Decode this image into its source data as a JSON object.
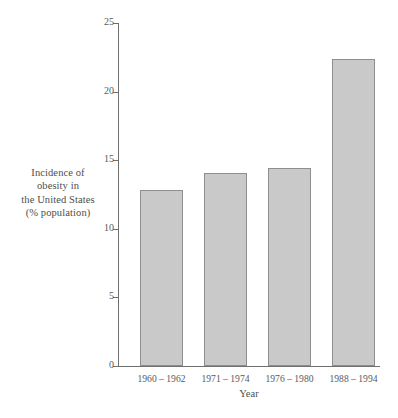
{
  "chart_data": {
    "type": "bar",
    "title": "",
    "subtitle": "",
    "xlabel": "Year",
    "ylabel_lines": [
      "Incidence of",
      "obesity in",
      "the United States",
      "(% population)"
    ],
    "ylabel": "Incidence of obesity in the United States (% population)",
    "categories": [
      "1960 – 1962",
      "1971 – 1974",
      "1976 – 1980",
      "1988 – 1994"
    ],
    "values": [
      12.8,
      14.1,
      14.4,
      22.4
    ],
    "ylim": [
      0,
      25
    ],
    "y_ticks": [
      0,
      5,
      10,
      15,
      20,
      25
    ],
    "y_tick_labels": [
      "0",
      "5",
      "10",
      "15",
      "20",
      "25"
    ],
    "x_ticks_shown": false,
    "grid": false,
    "legend": false,
    "legend_position": "none",
    "annotations": [],
    "series": [
      {
        "name": "Incidence of obesity in the United States (% population)",
        "values": [
          12.8,
          14.1,
          14.4,
          22.4
        ]
      }
    ]
  },
  "style": {
    "bar_fill": "#c9c9c9",
    "bar_stroke": "#8e8e8e",
    "axis_color": "#6f6f6f",
    "text_color": "#4d4d4d",
    "background": "#ffffff"
  }
}
